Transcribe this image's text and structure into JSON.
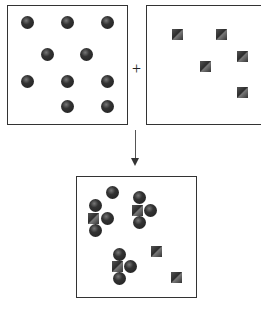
{
  "diagram": {
    "operator": "+",
    "reactant_a": {
      "label": "atoms of element A (spheres)",
      "count": 10,
      "positions": [
        [
          27,
          22
        ],
        [
          67,
          22
        ],
        [
          107,
          22
        ],
        [
          47,
          54
        ],
        [
          86,
          54
        ],
        [
          27,
          81
        ],
        [
          67,
          81
        ],
        [
          107,
          81
        ],
        [
          67,
          106
        ],
        [
          107,
          106
        ]
      ]
    },
    "reactant_b": {
      "label": "atoms of element B (cubes)",
      "count": 5,
      "positions": [
        [
          177,
          34
        ],
        [
          221,
          34
        ],
        [
          242,
          56
        ],
        [
          205,
          66
        ],
        [
          242,
          92
        ]
      ]
    },
    "product": {
      "label": "mixture after reaction",
      "molecules": [
        {
          "center_square": [
            93,
            218
          ],
          "spheres": [
            [
              95,
              205
            ],
            [
              107,
              218
            ],
            [
              95,
              230
            ]
          ]
        },
        {
          "center_square": [
            137,
            210
          ],
          "spheres": [
            [
              139,
              197
            ],
            [
              150,
              210
            ],
            [
              139,
              222
            ]
          ]
        },
        {
          "center_square": [
            117,
            266
          ],
          "spheres": [
            [
              119,
              254
            ],
            [
              130,
              266
            ],
            [
              119,
              278
            ]
          ]
        }
      ],
      "leftover_spheres": [
        [
          112,
          192
        ]
      ],
      "leftover_squares": [
        [
          156,
          251
        ],
        [
          176,
          277
        ]
      ]
    },
    "caption": ""
  }
}
